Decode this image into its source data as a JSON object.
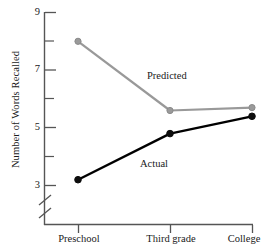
{
  "chart_data": {
    "type": "line",
    "title": "",
    "xlabel": "",
    "ylabel": "Number of Words Recalled",
    "categories": [
      "Preschool",
      "Third grade",
      "College"
    ],
    "series": [
      {
        "name": "Predicted",
        "color": "#999999",
        "values": [
          8.0,
          5.6,
          5.7
        ]
      },
      {
        "name": "Actual",
        "color": "#000000",
        "values": [
          3.2,
          4.8,
          5.4
        ]
      }
    ],
    "ylim": [
      2.55,
      9.0
    ],
    "yticks_major": [
      3,
      5,
      7,
      9
    ],
    "yticks_minor": [
      4,
      6,
      8
    ],
    "ytick_labels": [
      "3",
      "5",
      "7",
      "9"
    ],
    "axis_break": true,
    "grid": false,
    "legend_position": "inline-annotations",
    "annotations": [
      {
        "text": "Predicted",
        "x": 148,
        "y": 78
      },
      {
        "text": "Actual",
        "x": 141,
        "y": 166
      }
    ]
  },
  "axes": {
    "y_label": "Number of Words Recalled",
    "y_tick_labels": [
      "9",
      "7",
      "5",
      "3"
    ],
    "x_tick_labels": [
      "Preschool",
      "Third grade",
      "College"
    ]
  },
  "series_labels": {
    "predicted": "Predicted",
    "actual": "Actual"
  },
  "colors": {
    "predicted": "#999999",
    "actual": "#000000",
    "axis": "#555555",
    "background": "#ffffff"
  }
}
